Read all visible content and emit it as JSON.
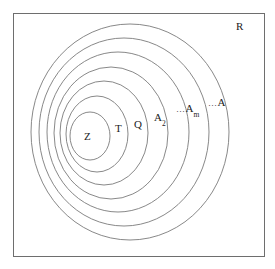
{
  "figure": {
    "kind": "nested-sets-venn-diagram",
    "colors": {
      "background": "#ffffff",
      "frame_stroke": "#6e6e6e",
      "circle_stroke": "#7a7a7a",
      "label_text": "#1c1c1c"
    },
    "frame": {
      "name": "ambient-region",
      "label": "R",
      "x": 13,
      "y": 13,
      "width": 251,
      "height": 243
    },
    "sets": [
      {
        "id": "Z",
        "label": "Z",
        "ellipsis": "",
        "subscript": "",
        "level": 1,
        "cx": 90,
        "cy": 136,
        "rx": 20,
        "ry": 24
      },
      {
        "id": "T",
        "label": "T",
        "ellipsis": "",
        "subscript": "",
        "level": 2,
        "cx": 97,
        "cy": 134,
        "rx": 31,
        "ry": 38
      },
      {
        "id": "Q",
        "label": "Q",
        "ellipsis": "",
        "subscript": "",
        "level": 3,
        "cx": 104,
        "cy": 133,
        "rx": 44,
        "ry": 52
      },
      {
        "id": "A2",
        "label": "A",
        "ellipsis": "",
        "subscript": "2",
        "level": 4,
        "cx": 111,
        "cy": 133,
        "rx": 57,
        "ry": 66
      },
      {
        "id": "Am",
        "label": "A",
        "ellipsis": "…",
        "subscript": "m",
        "level": 5,
        "cx": 118,
        "cy": 132,
        "rx": 71,
        "ry": 80
      },
      {
        "id": "A",
        "label": "A",
        "ellipsis": "…",
        "subscript": "",
        "level": 6,
        "cx": 124,
        "cy": 132,
        "rx": 85,
        "ry": 94
      },
      {
        "id": "Aouter",
        "label": "",
        "ellipsis": "",
        "subscript": "",
        "level": 7,
        "cx": 130,
        "cy": 132,
        "rx": 99,
        "ry": 108
      }
    ],
    "labels": {
      "Z": "Z",
      "T": "T",
      "Q": "Q",
      "A2_base": "A",
      "A2_sub": "2",
      "Am_ellipsis": "…",
      "Am_base": "A",
      "Am_sub": "m",
      "A_ellipsis": "…",
      "A_base": "A",
      "R": "R"
    }
  }
}
